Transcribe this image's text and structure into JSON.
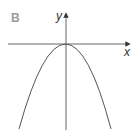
{
  "figure": {
    "panel_label": "B",
    "x_axis_label": "x",
    "y_axis_label": "y",
    "curve": "downward-opening parabola with vertex at origin",
    "colors": {
      "axis": "#444444",
      "curve": "#555555",
      "panel_label": "#9a9a9a"
    }
  }
}
